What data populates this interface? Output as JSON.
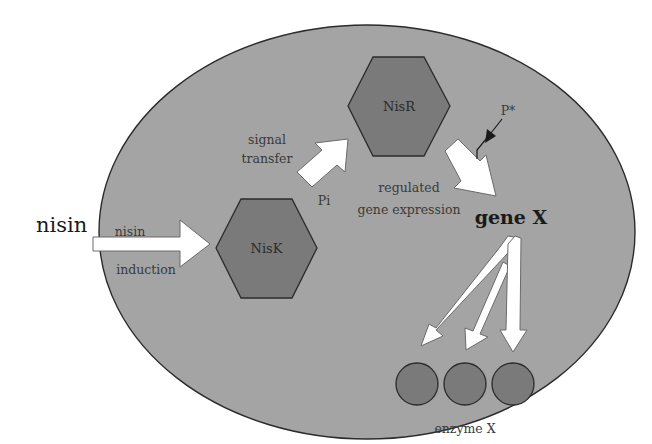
{
  "colors": {
    "background": "#ffffff",
    "cell_fill": "#a4a4a4",
    "cell_stroke": "#2b2b2b",
    "protein_fill": "#7a7a7a",
    "protein_stroke": "#2b2b2b",
    "arrow_fill": "#ffffff",
    "arrow_stroke": "#6a6a6a",
    "text": "#3a3a3a"
  },
  "external": {
    "nisin_label": "nisin"
  },
  "input_arrow": {
    "top_label": "nisin",
    "bottom_label": "induction"
  },
  "proteins": {
    "nisk": {
      "label": "NisK"
    },
    "nisr": {
      "label": "NisR"
    }
  },
  "signal": {
    "label_line1": "signal",
    "label_line2": "transfer",
    "phosphate_label": "Pi"
  },
  "regulation": {
    "label_line1": "regulated",
    "label_line2": "gene expression",
    "promoter_label": "P*"
  },
  "gene": {
    "label": "gene X"
  },
  "enzymes": {
    "label": "enzyme X",
    "count": 3
  }
}
